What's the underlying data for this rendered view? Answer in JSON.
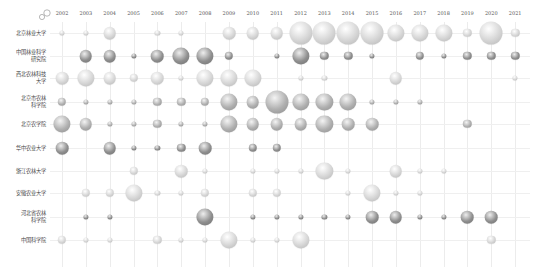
{
  "chart_data": {
    "type": "bubble-matrix",
    "title": "",
    "xlabel": "",
    "ylabel": "",
    "grid": true,
    "legend": "size-icon top-left",
    "size_scale": "relative 1-5 (estimated)",
    "years": [
      "2002",
      "2003",
      "2004",
      "2005",
      "2006",
      "2007",
      "2008",
      "2009",
      "2010",
      "2011",
      "2012",
      "2013",
      "2014",
      "2015",
      "2016",
      "2017",
      "2018",
      "2019",
      "2020",
      "2021"
    ],
    "rows": [
      {
        "label": "北京林业大学",
        "tone": "light",
        "values": {
          "2002": 1,
          "2003": 1,
          "2004": 3,
          "2006": 1,
          "2007": 1,
          "2009": 3,
          "2010": 3,
          "2011": 3,
          "2012": 5,
          "2013": 5,
          "2014": 5,
          "2015": 5,
          "2016": 4,
          "2017": 4,
          "2018": 4,
          "2019": 2,
          "2020": 5,
          "2021": 2
        }
      },
      {
        "label": "中国林业科学\n研究院",
        "tone": "dark",
        "values": {
          "2003": 3,
          "2004": 3,
          "2005": 1,
          "2006": 3,
          "2007": 4,
          "2008": 4,
          "2009": 2,
          "2011": 1,
          "2012": 4,
          "2013": 2,
          "2014": 2,
          "2015": 1,
          "2017": 2,
          "2018": 1,
          "2019": 2,
          "2020": 2,
          "2021": 2
        }
      },
      {
        "label": "西北农林科技\n大学",
        "tone": "light",
        "values": {
          "2002": 3,
          "2003": 4,
          "2004": 3,
          "2005": 2,
          "2006": 3,
          "2007": 1,
          "2008": 4,
          "2009": 4,
          "2010": 4,
          "2012": 1,
          "2013": 1,
          "2016": 3,
          "2021": 1
        }
      },
      {
        "label": "北京市农林\n科学院",
        "tone": "mid",
        "values": {
          "2002": 2,
          "2003": 1,
          "2004": 1,
          "2005": 1,
          "2006": 2,
          "2007": 2,
          "2008": 2,
          "2009": 4,
          "2010": 3,
          "2011": 5,
          "2012": 4,
          "2013": 4,
          "2014": 4,
          "2015": 1,
          "2016": 1,
          "2017": 1
        }
      },
      {
        "label": "北京农学院",
        "tone": "mid",
        "values": {
          "2002": 4,
          "2003": 3,
          "2004": 1,
          "2005": 1,
          "2006": 2,
          "2007": 1,
          "2008": 1,
          "2009": 4,
          "2010": 3,
          "2011": 3,
          "2012": 3,
          "2013": 4,
          "2014": 3,
          "2015": 3,
          "2019": 2
        }
      },
      {
        "label": "华中农业大学",
        "tone": "dark",
        "values": {
          "2002": 3,
          "2004": 3,
          "2005": 1,
          "2006": 1,
          "2007": 2,
          "2008": 3,
          "2010": 2,
          "2011": 2
        }
      },
      {
        "label": "浙江农林大学",
        "tone": "light",
        "values": {
          "2005": 2,
          "2007": 3,
          "2008": 1,
          "2010": 1,
          "2011": 1,
          "2012": 1,
          "2013": 4,
          "2014": 1,
          "2016": 3,
          "2017": 1,
          "2018": 1
        }
      },
      {
        "label": "安徽农业大学",
        "tone": "light",
        "values": {
          "2003": 2,
          "2004": 2,
          "2005": 4,
          "2006": 1,
          "2007": 1,
          "2008": 2,
          "2010": 2,
          "2011": 2,
          "2014": 1,
          "2015": 4,
          "2016": 1,
          "2017": 1
        }
      },
      {
        "label": "河北省农林\n科学院",
        "tone": "dark",
        "values": {
          "2003": 1,
          "2004": 1,
          "2008": 4,
          "2010": 1,
          "2011": 1,
          "2012": 1,
          "2013": 1,
          "2014": 1,
          "2015": 3,
          "2016": 3,
          "2017": 1,
          "2018": 1,
          "2019": 3,
          "2020": 3
        }
      },
      {
        "label": "中国科学院",
        "tone": "light",
        "values": {
          "2002": 2,
          "2003": 1,
          "2004": 1,
          "2006": 2,
          "2007": 1,
          "2008": 1,
          "2009": 4,
          "2010": 1,
          "2011": 1,
          "2012": 4,
          "2020": 2
        }
      }
    ]
  },
  "layout": {
    "x0": 62,
    "dx": 23.85,
    "row_y": [
      33,
      56,
      78,
      102,
      124,
      148,
      171,
      193,
      217,
      240
    ],
    "radius_by_size": {
      "1": 2.6,
      "2": 4.2,
      "3": 6.3,
      "4": 8.6,
      "5": 11.5
    },
    "tones": {
      "light": [
        "#ffffff",
        "#d6d6d6",
        "#b4b4b4"
      ],
      "mid": [
        "#f4f4f4",
        "#b0b0b0",
        "#8c8c8c"
      ],
      "dark": [
        "#eeeeee",
        "#8f8f8f",
        "#6e6e6e"
      ]
    }
  }
}
